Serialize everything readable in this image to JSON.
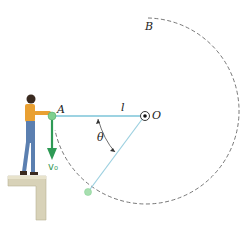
{
  "labels": {
    "point_a": "A",
    "point_b": "B",
    "point_o": "O",
    "length": "l",
    "angle": "θ",
    "velocity": "v₀"
  },
  "colors": {
    "rope": "#7cc4d8",
    "ball": "#7fcf8f",
    "velocity_arrow": "#2e9a55",
    "dashed_path": "#555555",
    "ledge": "#cfc9b0"
  }
}
